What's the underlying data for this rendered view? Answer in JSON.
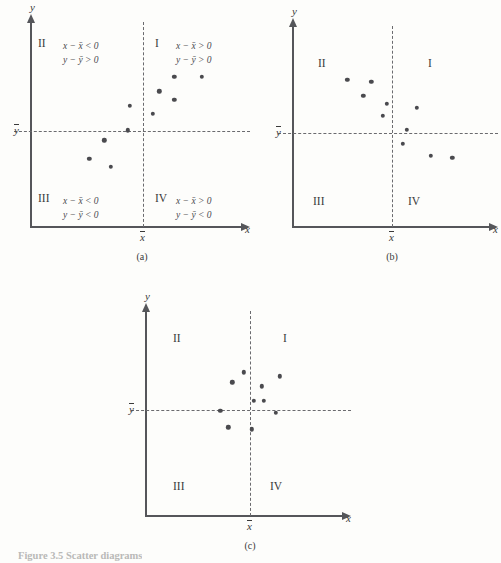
{
  "figure": {
    "caption": "Figure 3.5 Scatter diagrams",
    "axis_x_label": "x",
    "axis_y_label": "y",
    "mean_x_label": "x̄",
    "mean_y_label": "ȳ"
  },
  "quadrant_names": {
    "one": "I",
    "two": "II",
    "three": "III",
    "four": "IV"
  },
  "formulas": {
    "q2_line1": "x − x̄ < 0",
    "q2_line2": "y − ȳ > 0",
    "q1_line1": "x − x̄ > 0",
    "q1_line2": "y − ȳ > 0",
    "q3_line1": "x − x̄ < 0",
    "q3_line2": "y − ȳ < 0",
    "q4_line1": "x − x̄ > 0",
    "q4_line2": "y − ȳ < 0"
  },
  "panels": [
    {
      "id": "a",
      "caption": "(a)"
    },
    {
      "id": "b",
      "caption": "(b)"
    },
    {
      "id": "c",
      "caption": "(c)"
    }
  ],
  "chart_data": [
    {
      "type": "scatter",
      "title": "(a)",
      "xlabel": "x",
      "ylabel": "y",
      "xlim": [
        0,
        100
      ],
      "ylim": [
        0,
        100
      ],
      "grid": false,
      "legend": false,
      "mean_x": 55,
      "mean_y": 56,
      "relationship": "positive",
      "quadrant_labels": [
        "I",
        "II",
        "III",
        "IV"
      ],
      "annotations": [
        "x − x̄ < 0",
        "y − ȳ > 0",
        "x − x̄ > 0",
        "y − ȳ > 0",
        "x − x̄ < 0",
        "y − ȳ < 0",
        "x − x̄ > 0",
        "y − ȳ < 0"
      ],
      "points": [
        {
          "x": 28,
          "y": 33
        },
        {
          "x": 38,
          "y": 29
        },
        {
          "x": 35,
          "y": 42
        },
        {
          "x": 46,
          "y": 47
        },
        {
          "x": 47,
          "y": 59
        },
        {
          "x": 58,
          "y": 55
        },
        {
          "x": 61,
          "y": 66
        },
        {
          "x": 68,
          "y": 62
        },
        {
          "x": 68,
          "y": 73
        },
        {
          "x": 81,
          "y": 73
        }
      ]
    },
    {
      "type": "scatter",
      "title": "(b)",
      "xlabel": "x",
      "ylabel": "y",
      "xlim": [
        0,
        100
      ],
      "ylim": [
        0,
        100
      ],
      "grid": false,
      "legend": false,
      "mean_x": 55,
      "mean_y": 56,
      "relationship": "negative",
      "quadrant_labels": [
        "I",
        "II",
        "III",
        "IV"
      ],
      "points": [
        {
          "x": 28,
          "y": 73
        },
        {
          "x": 40,
          "y": 72
        },
        {
          "x": 36,
          "y": 65
        },
        {
          "x": 48,
          "y": 61
        },
        {
          "x": 46,
          "y": 55
        },
        {
          "x": 63,
          "y": 59
        },
        {
          "x": 58,
          "y": 48
        },
        {
          "x": 56,
          "y": 41
        },
        {
          "x": 70,
          "y": 35
        },
        {
          "x": 81,
          "y": 34
        }
      ]
    },
    {
      "type": "scatter",
      "title": "(c)",
      "xlabel": "x",
      "ylabel": "y",
      "xlim": [
        0,
        100
      ],
      "ylim": [
        0,
        100
      ],
      "grid": false,
      "legend": false,
      "mean_x": 55,
      "mean_y": 56,
      "relationship": "none",
      "quadrant_labels": [
        "I",
        "II",
        "III",
        "IV"
      ],
      "points": [
        {
          "x": 50,
          "y": 70
        },
        {
          "x": 44,
          "y": 65
        },
        {
          "x": 68,
          "y": 68
        },
        {
          "x": 59,
          "y": 63
        },
        {
          "x": 55,
          "y": 56
        },
        {
          "x": 60,
          "y": 56
        },
        {
          "x": 38,
          "y": 51
        },
        {
          "x": 66,
          "y": 50
        },
        {
          "x": 42,
          "y": 43
        },
        {
          "x": 54,
          "y": 42
        }
      ]
    }
  ]
}
